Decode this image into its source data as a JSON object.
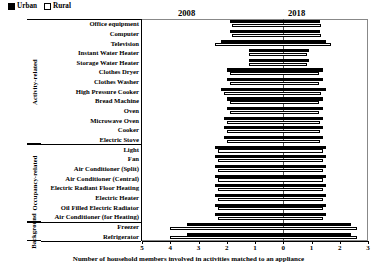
{
  "legend": {
    "items": [
      {
        "label": "Urban",
        "style": "filled",
        "color": "#000000"
      },
      {
        "label": "Rural",
        "style": "open",
        "color": "#ffffff"
      }
    ]
  },
  "year_headers": {
    "left": "2008",
    "right": "2018"
  },
  "groups": [
    {
      "name": "Activity-related",
      "rows": 13
    },
    {
      "name": "Occupancy-related",
      "rows": 8
    },
    {
      "name": "Background",
      "rows": 2
    }
  ],
  "axis": {
    "title": "Number of household members involved in activities matched to an appliance",
    "ticks": [
      "5",
      "4",
      "3",
      "2",
      "1",
      "0",
      "1",
      "2",
      "3"
    ],
    "left_max": 5,
    "right_max": 3
  },
  "chart_data": {
    "type": "bar",
    "title": "",
    "subtitle": "",
    "xlabel": "Number of household members involved in activities matched to an appliance",
    "ylabel": "",
    "orientation": "horizontal",
    "layout": "diverging butterfly: 2008 values extend left of zero, 2018 values extend right of zero",
    "grid": false,
    "legend_position": "top-left",
    "legend": [
      "Urban",
      "Rural"
    ],
    "xlim": [
      -5,
      3
    ],
    "xticks": [
      5,
      4,
      3,
      2,
      1,
      0,
      1,
      2,
      3
    ],
    "categories": [
      "Office equipment",
      "Computer",
      "Television",
      "Instant Water Heater",
      "Storage Water Heater",
      "Clothes Dryer",
      "Clothes Washer",
      "High Pressure Cooker",
      "Bread Machine",
      "Oven",
      "Microwave Oven",
      "Cooker",
      "Electric Stove",
      "Light",
      "Fan",
      "Air Conditioner (Split)",
      "Air Conditioner (Central)",
      "Electric Radiant Floor Heating",
      "Electric Heater",
      "Oil Filled Electric Radiator",
      "Air Conditioner (for Heating)",
      "Freezer",
      "Refrigerator"
    ],
    "series": [
      {
        "name": "Urban",
        "year_2008": [
          1.9,
          1.9,
          2.2,
          1.2,
          1.2,
          2.0,
          2.0,
          2.2,
          2.0,
          2.0,
          2.1,
          2.1,
          2.1,
          2.4,
          2.4,
          2.4,
          2.4,
          2.4,
          2.4,
          2.4,
          2.4,
          3.4,
          3.4
        ],
        "year_2018": [
          1.3,
          1.3,
          1.5,
          0.9,
          0.9,
          1.4,
          1.4,
          1.5,
          1.4,
          1.4,
          1.4,
          1.4,
          1.4,
          1.5,
          1.5,
          1.5,
          1.5,
          1.5,
          1.5,
          1.5,
          1.5,
          2.4,
          2.4
        ]
      },
      {
        "name": "Rural",
        "year_2008": [
          1.8,
          1.8,
          2.4,
          1.2,
          1.2,
          1.9,
          1.9,
          2.1,
          1.9,
          1.9,
          2.0,
          2.0,
          2.0,
          2.3,
          2.3,
          2.3,
          2.3,
          2.3,
          2.3,
          2.3,
          2.3,
          4.0,
          4.0
        ],
        "year_2018": [
          1.35,
          1.35,
          1.7,
          0.85,
          0.85,
          1.25,
          1.25,
          1.35,
          1.25,
          1.25,
          1.3,
          1.3,
          1.3,
          1.4,
          1.4,
          1.4,
          1.4,
          1.4,
          1.4,
          1.4,
          1.4,
          2.6,
          2.6
        ]
      }
    ]
  }
}
